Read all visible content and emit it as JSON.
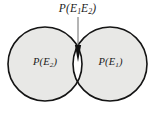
{
  "figure": {
    "type": "venn-diagram",
    "caption_labels": {
      "intersection": {
        "prefix": "P(E",
        "sub_first": "1",
        "mid": "E",
        "sub_second": "2",
        "suffix": ")",
        "full_text": "P(E1E2)"
      },
      "left_circle": {
        "prefix": "P(E",
        "sub": "2",
        "suffix": ")",
        "full_text": "P(E2)"
      },
      "right_circle": {
        "prefix": "P(E",
        "sub": "1",
        "suffix": ")",
        "full_text": "P(E1)"
      }
    },
    "colors": {
      "background": "#ffffff",
      "circle_fill": "#e8e8e6",
      "circle_stroke": "#141414",
      "intersection_fill": "#ffffff",
      "leader_line": "#5a5a5a",
      "arrow_fill": "#111111",
      "text": "#1a1a1a"
    },
    "geometry": {
      "canvas_width": 155,
      "canvas_height": 113,
      "left_circle": {
        "cx": 45,
        "cy": 64,
        "r": 37
      },
      "right_circle": {
        "cx": 110,
        "cy": 64,
        "r": 37
      },
      "stroke_width": 1.6,
      "leader_line": {
        "x": 78,
        "y_start": 17,
        "y_end": 45
      },
      "arrow": {
        "x": 78,
        "y_tip": 62,
        "y_base": 45,
        "half_width": 3.2
      }
    }
  }
}
